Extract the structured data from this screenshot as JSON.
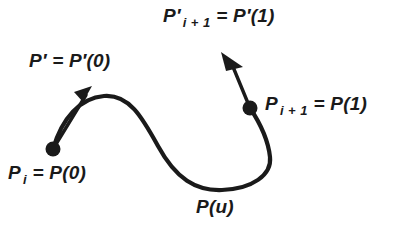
{
  "figure": {
    "width": 407,
    "height": 231,
    "background_color": "#ffffff",
    "ink_color": "#1a1a1a"
  },
  "labels": {
    "tangent_end": {
      "id": "tangent-end-label",
      "full_text": "P' i + 1 = P'(1)",
      "base": "P",
      "prime": "′",
      "subscript": "i + 1",
      "rhs": "= P′(1)"
    },
    "tangent_start": {
      "id": "tangent-start-label",
      "full_text": "P' = P'(0)",
      "base": "P",
      "prime": "′",
      "subscript": "",
      "rhs": "= P′(0)"
    },
    "point_end": {
      "id": "point-end-label",
      "full_text": "P i + 1 = P(1)",
      "base": "P",
      "prime": "",
      "subscript": "i + 1",
      "rhs": "= P(1)"
    },
    "point_start": {
      "id": "point-start-label",
      "full_text": "P i = P(0)",
      "base": "P",
      "prime": "",
      "subscript": "i",
      "rhs": "= P(0)"
    },
    "curve_point": {
      "id": "curve-point-label",
      "full_text": "P(u)",
      "base": "P",
      "prime": "",
      "subscript": "",
      "rhs": "(u)"
    }
  },
  "geometry": {
    "curve": {
      "name": "parametric-curve",
      "path": "M 53 149 C 62 118 80 98 104 96 C 129 94 142 117 158 146 C 176 179 196 191 222 190 C 252 189 272 175 270 157 C 268 138 258 120 250 108",
      "stroke_width": 4.2
    },
    "start_point": {
      "cx": 53,
      "cy": 149,
      "r": 7.5
    },
    "end_point": {
      "cx": 250,
      "cy": 108,
      "r": 7.5
    },
    "start_tangent": {
      "x1": 53,
      "y1": 149,
      "x2": 86,
      "y2": 95,
      "stroke_width": 3.4,
      "head": "74,92 92,86 83,102"
    },
    "end_tangent": {
      "x1": 250,
      "y1": 108,
      "x2": 231,
      "y2": 62,
      "stroke_width": 3.4,
      "head": "221,52 243,67 226,71"
    }
  }
}
